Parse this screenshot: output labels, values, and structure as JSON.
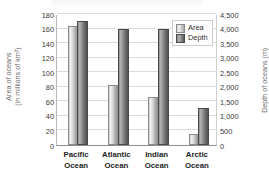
{
  "chart_data": {
    "type": "bar",
    "title": "",
    "subtitle": "",
    "categories": [
      "Pacific Ocean",
      "Atlantic Ocean",
      "Indian Ocean",
      "Arctic Ocean"
    ],
    "category_lines": [
      [
        "Pacific",
        "Ocean"
      ],
      [
        "Atlantic",
        "Ocean"
      ],
      [
        "Indian",
        "Ocean"
      ],
      [
        "Arctic",
        "Ocean"
      ]
    ],
    "series": [
      {
        "name": "Area",
        "axis": "left",
        "unit": "millions of km2",
        "values": [
          161,
          80,
          63,
          13
        ]
      },
      {
        "name": "Depth",
        "axis": "right",
        "unit": "m",
        "values": [
          4200,
          3900,
          3900,
          1220
        ]
      }
    ],
    "xlabel": "",
    "ylabel": "Area of oceans (in millions of km²)",
    "y2label": "Depth of oceans (m)",
    "ylim": [
      0,
      180
    ],
    "y2lim": [
      0,
      4500
    ],
    "ytick_labels": [
      "180",
      "160",
      "140",
      "120",
      "100",
      "80",
      "60",
      "40",
      "20",
      "0"
    ],
    "ytick_values": [
      180,
      160,
      140,
      120,
      100,
      80,
      60,
      40,
      20,
      0
    ],
    "y2tick_labels": [
      "4,500",
      "4,000",
      "3,500",
      "3,000",
      "2,500",
      "2,000",
      "1,500",
      "1,000",
      "500",
      "0"
    ],
    "y2tick_values": [
      4500,
      4000,
      3500,
      3000,
      2500,
      2000,
      1500,
      1000,
      500,
      0
    ],
    "grid": true,
    "grid_axis": "y",
    "legend": [
      "Area",
      "Depth"
    ],
    "legend_position": "top-right",
    "colors": {
      "area_bar": "#d2d2d2",
      "depth_bar": "#8f8f8f",
      "gridline": "#dcdcdc",
      "axis": "#8f8f8f",
      "axis_title_text": "#6d6d6d",
      "tick_text": "#3b3b3b",
      "category_text": "#1d1d1d",
      "plot_background": "#ffffff"
    }
  },
  "axis_titles": {
    "left_line1": "Area of oceans",
    "left_line2": "(in millions of km²)",
    "right": "Depth of oceans (m)"
  },
  "legend": {
    "area_label": "Area",
    "depth_label": "Depth"
  }
}
